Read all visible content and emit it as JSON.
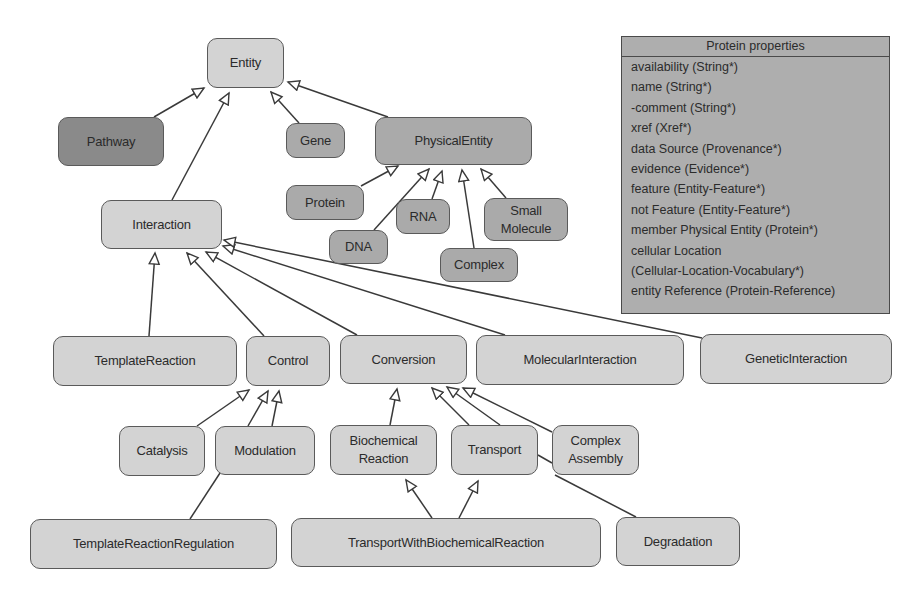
{
  "diagram": {
    "colors": {
      "background": "#ffffff",
      "node_light": "#d3d3d3",
      "node_mid": "#aaaaaa",
      "node_dark": "#8a8a8a",
      "stroke": "#4a4a4a",
      "panel": "#aeaeae"
    },
    "nodes": {
      "entity": "Entity",
      "pathway": "Pathway",
      "gene": "Gene",
      "physical_entity": "PhysicalEntity",
      "protein": "Protein",
      "rna": "RNA",
      "dna": "DNA",
      "small_molecule": "Small Molecule",
      "complex": "Complex",
      "interaction": "Interaction",
      "template_reaction": "TemplateReaction",
      "control": "Control",
      "conversion": "Conversion",
      "molecular_interaction": "MolecularInteraction",
      "genetic_interaction": "GeneticInteraction",
      "catalysis": "Catalysis",
      "modulation": "Modulation",
      "biochemical_reaction": "Biochemical Reaction",
      "transport": "Transport",
      "complex_assembly": "Complex Assembly",
      "template_reaction_regulation": "TemplateReactionRegulation",
      "transport_with_biochemical_reaction": "TransportWithBiochemicalReaction",
      "degradation": "Degradation"
    },
    "edges": [
      {
        "from": "Pathway",
        "to": "Entity"
      },
      {
        "from": "Interaction",
        "to": "Entity"
      },
      {
        "from": "Gene",
        "to": "Entity"
      },
      {
        "from": "PhysicalEntity",
        "to": "Entity"
      },
      {
        "from": "Protein",
        "to": "PhysicalEntity"
      },
      {
        "from": "DNA",
        "to": "PhysicalEntity"
      },
      {
        "from": "RNA",
        "to": "PhysicalEntity"
      },
      {
        "from": "Complex",
        "to": "PhysicalEntity"
      },
      {
        "from": "Small Molecule",
        "to": "PhysicalEntity"
      },
      {
        "from": "TemplateReaction",
        "to": "Interaction"
      },
      {
        "from": "Control",
        "to": "Interaction"
      },
      {
        "from": "Conversion",
        "to": "Interaction"
      },
      {
        "from": "MolecularInteraction",
        "to": "Interaction"
      },
      {
        "from": "GeneticInteraction",
        "to": "Interaction"
      },
      {
        "from": "Catalysis",
        "to": "Control"
      },
      {
        "from": "Modulation",
        "to": "Control"
      },
      {
        "from": "TemplateReactionRegulation",
        "to": "Control"
      },
      {
        "from": "Biochemical Reaction",
        "to": "Conversion"
      },
      {
        "from": "Transport",
        "to": "Conversion"
      },
      {
        "from": "Complex Assembly",
        "to": "Conversion"
      },
      {
        "from": "Degradation",
        "to": "Conversion"
      },
      {
        "from": "TransportWithBiochemicalReaction",
        "to": "Biochemical Reaction"
      },
      {
        "from": "TransportWithBiochemicalReaction",
        "to": "Transport"
      }
    ]
  },
  "protein_properties": {
    "title": "Protein properties",
    "rows": [
      "availability (String*)",
      "name (String*)",
      "-comment (String*)",
      "xref (Xref*)",
      "data Source (Provenance*)",
      "evidence (Evidence*)",
      "feature (Entity-Feature*)",
      "not Feature (Entity-Feature*)",
      "member Physical Entity (Protein*)",
      "cellular Location",
      "(Cellular-Location-Vocabulary*)",
      "entity Reference (Protein-Reference)"
    ]
  }
}
